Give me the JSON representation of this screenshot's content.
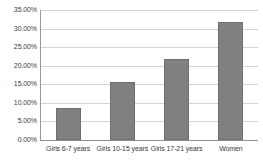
{
  "chart_data": {
    "type": "bar",
    "title": "",
    "subtitle": "",
    "xlabel": "",
    "ylabel": "",
    "categories": [
      "Girls 6-7 years",
      "Girls 10-15 years",
      "Girls 17-21 years",
      "Women"
    ],
    "values": [
      8.7,
      15.7,
      21.9,
      31.8
    ],
    "value_labels": [
      "8.70%",
      "15.70%",
      "21.90%",
      "31.80%"
    ],
    "ylim": [
      0,
      35
    ],
    "ytick_values": [
      0,
      5,
      10,
      15,
      20,
      25,
      30,
      35
    ],
    "ytick_labels": [
      "0.00%",
      "5.00%",
      "10.00%",
      "15.00%",
      "20.00%",
      "25.00%",
      "30.00%",
      "35.00%"
    ],
    "grid": true,
    "legend": false,
    "legend_position": "none",
    "series": [
      {
        "name": "",
        "values": [
          8.7,
          15.7,
          21.9,
          31.8
        ],
        "color": "#808080"
      }
    ],
    "colors": {
      "bar_fill": "#808080",
      "bar_border": "#6f6f6f",
      "gridline": "#d4d4d4",
      "axis": "#8e8e8e",
      "text": "#3a3a3a",
      "background": "#ffffff"
    }
  }
}
